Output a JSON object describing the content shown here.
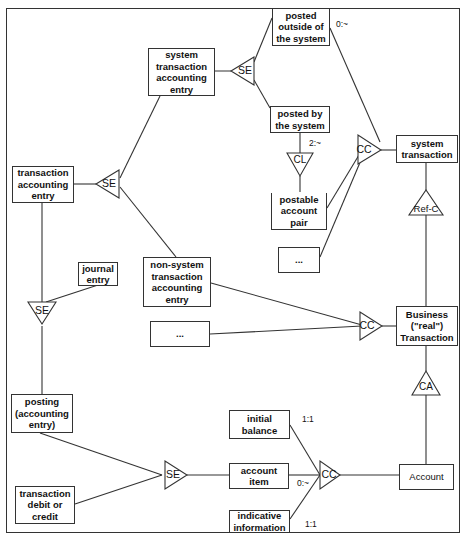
{
  "diagram": {
    "entities": {
      "posted_outside": "posted\noutside of\nthe system",
      "system_tae": "system\ntransaction\naccounting\nentry",
      "posted_by": "posted by\nthe system",
      "system_transaction": "system\ntransaction",
      "transaction_ae": "transaction\naccounting\nentry",
      "postable_pair": "postable\naccount\npair",
      "ellipsis_1": "...",
      "journal_entry": "journal\nentry",
      "nonsystem_tae": "non-system\ntransaction\naccounting\nentry",
      "ellipsis_2": "...",
      "business_transaction": "Business\n(\"real\")\nTransaction",
      "posting": "posting\n(accounting\nentry)",
      "initial_balance": "initial\nbalance",
      "account_item": "account\nitem",
      "indicative_information": "indicative\ninformation",
      "transaction_debit_credit": "transaction\ndebit or\ncredit",
      "account": "Account"
    },
    "connectors": {
      "se_top": "SE",
      "se_left": "SE",
      "se_journal": "SE",
      "cc_top": "CC",
      "cl": "CL",
      "ref_c": "Ref-C",
      "cc_middle": "CC",
      "ca": "CA",
      "se_bottom": "SE",
      "cc_bottom": "CC"
    },
    "cardinalities": {
      "outside_cc": "0:~",
      "posted_by_cl": "2:~",
      "initial_balance": "1:1",
      "account_item": "0:~",
      "indicative_information": "1:1"
    }
  }
}
